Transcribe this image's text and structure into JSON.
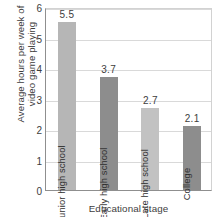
{
  "chart_data": {
    "type": "bar",
    "title": "",
    "xlabel": "Educational stage",
    "ylabel_line1": "Average hours per week of",
    "ylabel_line2": "video game playing",
    "categories": [
      "Junior high school",
      "Early high school",
      "Late high school",
      "College"
    ],
    "values": [
      5.5,
      3.7,
      2.7,
      2.1
    ],
    "value_labels": [
      "5.5",
      "3.7",
      "2.7",
      "2.1"
    ],
    "bar_colors": [
      "#b6b6b6",
      "#8d8d8d",
      "#c2c2c2",
      "#8d8d8d"
    ],
    "ylim": [
      0,
      6
    ],
    "yticks": [
      0,
      1,
      2,
      3,
      4,
      5,
      6
    ],
    "ytick_labels": [
      "0",
      "1",
      "2",
      "3",
      "4",
      "5",
      "6"
    ],
    "grid": true,
    "legend": "none",
    "axis_color": "#8f8f8f",
    "grid_color": "#d9d9d9",
    "text_color": "#3d3d3d",
    "background": "#ffffff"
  }
}
